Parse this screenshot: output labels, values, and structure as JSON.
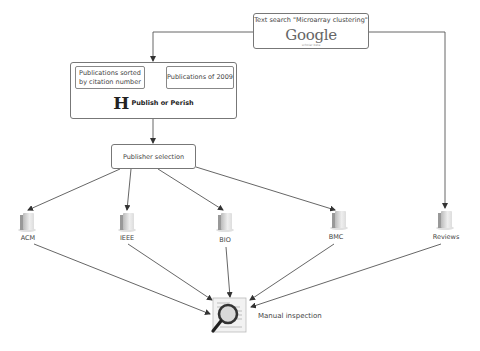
{
  "diagram": {
    "google_box": {
      "query": "Text search \"Microarray clustering\"",
      "logo": "Google",
      "logo_sub": "scholar beta"
    },
    "publish_or_perish": {
      "left_option": "Publications sorted by citation number",
      "right_option": "Publications of 2009",
      "logo_letter": "H",
      "title": "Publish or Perish"
    },
    "publisher_selection": "Publisher selection",
    "sources": [
      {
        "id": "acm",
        "label": "ACM",
        "icon": "database-icon"
      },
      {
        "id": "ieee",
        "label": "IEEE",
        "icon": "database-icon"
      },
      {
        "id": "bio",
        "label": "BIO",
        "icon": "database-icon"
      },
      {
        "id": "bmc",
        "label": "BMC",
        "icon": "database-icon"
      },
      {
        "id": "reviews",
        "label": "Reviews",
        "icon": "database-icon"
      }
    ],
    "manual_inspection": {
      "label": "Manual inspection",
      "icon": "magnifier-document-icon"
    },
    "colors": {
      "line": "#444444",
      "box_border": "#777777",
      "text": "#444444"
    },
    "edges": [
      {
        "from": "google_box",
        "to": "publish_or_perish"
      },
      {
        "from": "google_box",
        "to": "reviews"
      },
      {
        "from": "publish_or_perish",
        "to": "publisher_selection"
      },
      {
        "from": "publisher_selection",
        "to": "acm"
      },
      {
        "from": "publisher_selection",
        "to": "ieee"
      },
      {
        "from": "publisher_selection",
        "to": "bio"
      },
      {
        "from": "publisher_selection",
        "to": "bmc"
      },
      {
        "from": "acm",
        "to": "manual_inspection"
      },
      {
        "from": "ieee",
        "to": "manual_inspection"
      },
      {
        "from": "bio",
        "to": "manual_inspection"
      },
      {
        "from": "bmc",
        "to": "manual_inspection"
      },
      {
        "from": "reviews",
        "to": "manual_inspection"
      }
    ]
  }
}
